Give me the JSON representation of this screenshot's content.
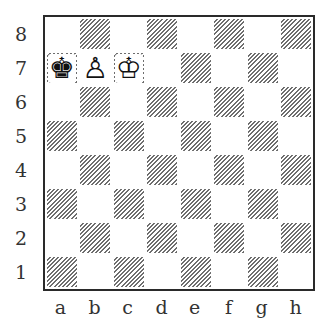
{
  "diagram": {
    "type": "chess-position",
    "ranks": [
      "8",
      "7",
      "6",
      "5",
      "4",
      "3",
      "2",
      "1"
    ],
    "files": [
      "a",
      "b",
      "c",
      "d",
      "e",
      "f",
      "g",
      "h"
    ],
    "colors": {
      "light_square": "#ffffff",
      "dark_square_hatch": "#6e6e6e",
      "border": "#2a2a2a",
      "label_text": "#333333"
    },
    "pieces": [
      {
        "square": "a7",
        "piece": "king",
        "color": "black",
        "glyph": "♚"
      },
      {
        "square": "b7",
        "piece": "pawn",
        "color": "white",
        "glyph": "♙"
      },
      {
        "square": "c7",
        "piece": "king",
        "color": "white",
        "glyph": "♔"
      }
    ]
  }
}
